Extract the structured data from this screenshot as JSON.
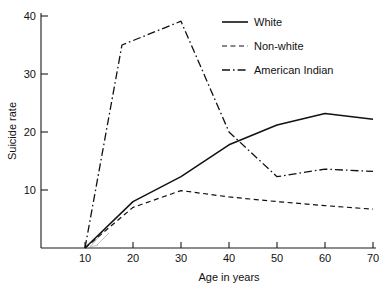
{
  "chart_data": {
    "type": "line",
    "title": "",
    "xlabel": "Age in years",
    "ylabel": "Suicide rate",
    "xlim": [
      5,
      70
    ],
    "ylim": [
      0,
      40
    ],
    "xticks": [
      10,
      20,
      30,
      40,
      50,
      60,
      70
    ],
    "xtick_labels": [
      "10",
      "20",
      "30",
      "40",
      "50",
      "60",
      "70"
    ],
    "yticks": [
      10,
      20,
      30,
      40
    ],
    "ytick_labels": [
      "10",
      "20",
      "30",
      "40"
    ],
    "grid": false,
    "legend_position": "top-right",
    "series": [
      {
        "name": "White",
        "style": "solid",
        "x": [
          10,
          20,
          30,
          40,
          50,
          60,
          70
        ],
        "y": [
          0,
          8.0,
          12.3,
          17.8,
          21.2,
          23.2,
          22.2
        ]
      },
      {
        "name": "Non-white",
        "style": "dashed",
        "x": [
          10,
          20,
          30,
          40,
          50,
          60,
          70
        ],
        "y": [
          0,
          7.0,
          9.9,
          8.8,
          8.0,
          7.3,
          6.7
        ]
      },
      {
        "name": "American Indian",
        "style": "dash-dot",
        "x": [
          10,
          17.7,
          30,
          40,
          50,
          60,
          70
        ],
        "y": [
          0,
          35.0,
          39.1,
          20.0,
          12.3,
          13.6,
          13.2
        ]
      }
    ]
  },
  "axes": {
    "y_label": "Suicide rate",
    "x_label": "Age in years"
  },
  "legend": {
    "entries": [
      {
        "label": "White",
        "style": "solid"
      },
      {
        "label": "Non-white",
        "style": "dashed"
      },
      {
        "label": "American Indian",
        "style": "dash-dot"
      }
    ]
  },
  "tick_labels": {
    "y": [
      "40",
      "30",
      "20",
      "10"
    ],
    "x": [
      "10",
      "20",
      "30",
      "40",
      "50",
      "60",
      "70"
    ]
  },
  "colors": {
    "ink": "#111111",
    "background": "#ffffff"
  }
}
